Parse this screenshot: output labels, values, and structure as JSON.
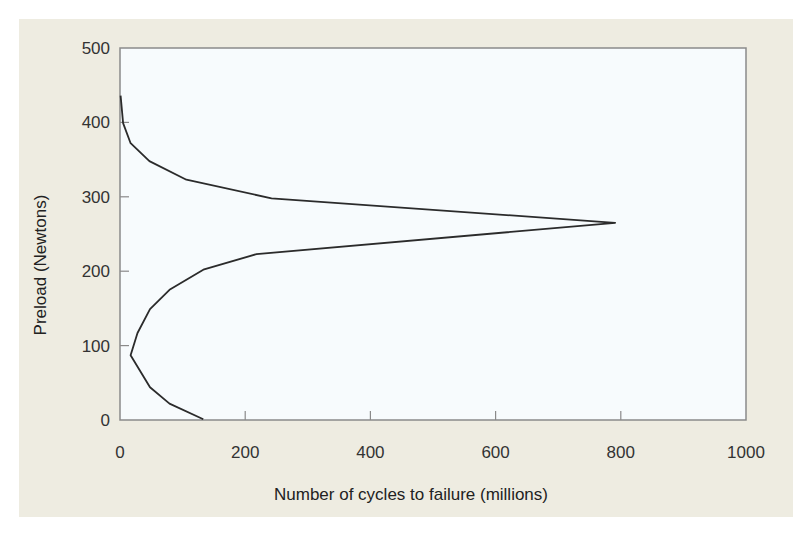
{
  "chart_data": {
    "type": "line",
    "title": "",
    "xlabel": "Number of cycles to failure (millions)",
    "ylabel": "Preload (Newtons)",
    "xlim": [
      0,
      1000
    ],
    "ylim": [
      0,
      500
    ],
    "x_ticks": [
      "0",
      "200",
      "400",
      "600",
      "800",
      "1000"
    ],
    "y_ticks": [
      "0",
      "100",
      "200",
      "300",
      "400",
      "500"
    ],
    "grid": false,
    "legend": null,
    "series": [
      {
        "name": "Preload vs cycles to failure",
        "color": "#2b2b2b",
        "points": [
          {
            "x": 133,
            "y": 1
          },
          {
            "x": 79,
            "y": 22
          },
          {
            "x": 48,
            "y": 44
          },
          {
            "x": 17,
            "y": 87
          },
          {
            "x": 28,
            "y": 117
          },
          {
            "x": 48,
            "y": 149
          },
          {
            "x": 79,
            "y": 175
          },
          {
            "x": 133,
            "y": 202
          },
          {
            "x": 218,
            "y": 223
          },
          {
            "x": 791,
            "y": 265
          },
          {
            "x": 242,
            "y": 298
          },
          {
            "x": 106,
            "y": 323
          },
          {
            "x": 47,
            "y": 348
          },
          {
            "x": 17,
            "y": 372
          },
          {
            "x": 5,
            "y": 399
          },
          {
            "x": 1,
            "y": 436
          }
        ]
      }
    ]
  },
  "colors": {
    "panel_background": "#eeece1",
    "plot_background": "#f7fbfd",
    "axis": "#8a8a8a",
    "line": "#2b2b2b"
  }
}
